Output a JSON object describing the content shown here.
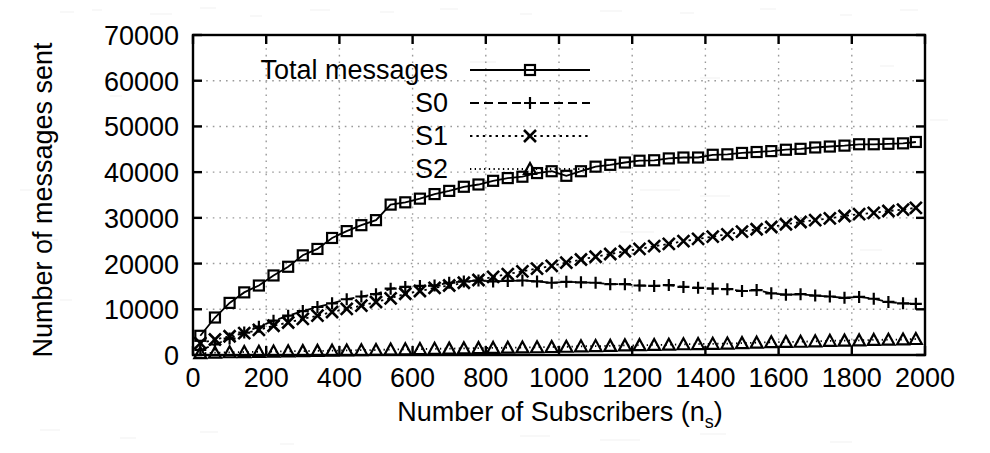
{
  "chart_data": {
    "type": "line",
    "title": "",
    "xlabel": "Number of Subscribers (n_s)",
    "xlabel_main": "Number of Subscribers (n",
    "xlabel_sub": "s",
    "xlabel_close": ")",
    "ylabel": "Number of messages sent",
    "xlim": [
      0,
      2000
    ],
    "ylim": [
      0,
      70000
    ],
    "xticks": [
      0,
      200,
      400,
      600,
      800,
      1000,
      1200,
      1400,
      1600,
      1800,
      2000
    ],
    "xtick_labels": [
      "0",
      "200",
      "400",
      "600",
      "800",
      "1000",
      "1200",
      "1400",
      "1600",
      "1800",
      "2000"
    ],
    "yticks": [
      0,
      10000,
      20000,
      30000,
      40000,
      50000,
      60000,
      70000
    ],
    "ytick_labels": [
      "0",
      "10000",
      "20000",
      "30000",
      "40000",
      "50000",
      "60000",
      "70000"
    ],
    "grid": true,
    "grid_style": "dotted",
    "legend_position": "top-left-inside",
    "x": [
      20,
      60,
      100,
      140,
      180,
      220,
      260,
      300,
      340,
      380,
      420,
      460,
      500,
      540,
      580,
      620,
      660,
      700,
      740,
      780,
      820,
      860,
      900,
      940,
      980,
      1020,
      1060,
      1100,
      1140,
      1180,
      1220,
      1260,
      1300,
      1340,
      1380,
      1420,
      1460,
      1500,
      1540,
      1580,
      1620,
      1660,
      1700,
      1740,
      1780,
      1820,
      1860,
      1900,
      1940,
      1975
    ],
    "series": [
      {
        "name": "Total messages",
        "marker": "square",
        "line_style": "solid",
        "values": [
          4200,
          8200,
          11400,
          13700,
          15200,
          17400,
          19300,
          21800,
          23200,
          25600,
          27100,
          28400,
          29500,
          32900,
          33400,
          34200,
          35200,
          35900,
          36800,
          37300,
          38100,
          38700,
          39000,
          39800,
          40200,
          39200,
          40200,
          41200,
          41600,
          42100,
          42500,
          42600,
          43000,
          43200,
          43200,
          43800,
          43900,
          44200,
          44400,
          44600,
          44900,
          45100,
          45400,
          45600,
          45800,
          46100,
          46100,
          46200,
          46300,
          46600
        ]
      },
      {
        "name": "S0",
        "marker": "plus",
        "line_style": "dashed",
        "values": [
          1100,
          2300,
          3600,
          4900,
          6200,
          7500,
          8600,
          9600,
          10500,
          11300,
          12200,
          12800,
          13300,
          14500,
          14900,
          15100,
          15200,
          15800,
          16100,
          16300,
          16100,
          16200,
          16300,
          16100,
          15800,
          16000,
          15900,
          15800,
          15500,
          15500,
          15200,
          15100,
          15300,
          14900,
          14700,
          14500,
          14400,
          14000,
          14200,
          13500,
          13200,
          13300,
          13000,
          12800,
          12500,
          12700,
          12300,
          11600,
          11300,
          11200
        ]
      },
      {
        "name": "S1",
        "marker": "cross",
        "line_style": "dotted",
        "values": [
          2600,
          3400,
          4100,
          4800,
          5500,
          6400,
          7100,
          7900,
          8600,
          9400,
          10100,
          10800,
          11600,
          12400,
          13400,
          14000,
          14700,
          15200,
          15800,
          16400,
          17100,
          17700,
          18300,
          18900,
          19500,
          20200,
          20900,
          21500,
          22100,
          22700,
          23200,
          23800,
          24300,
          24900,
          25400,
          25900,
          26400,
          27000,
          27500,
          28000,
          28600,
          29100,
          29500,
          29900,
          30400,
          30800,
          31100,
          31500,
          31800,
          32200
        ]
      },
      {
        "name": "S2",
        "marker": "triangle",
        "line_style": "fine-dotted",
        "values": [
          400,
          500,
          600,
          650,
          700,
          750,
          800,
          850,
          900,
          950,
          1000,
          1050,
          1100,
          1200,
          1250,
          1300,
          1350,
          1400,
          1450,
          1500,
          1550,
          1600,
          1650,
          1700,
          1750,
          1800,
          1900,
          1950,
          2000,
          2100,
          2150,
          2200,
          2250,
          2350,
          2400,
          2450,
          2500,
          2600,
          2700,
          2800,
          2850,
          2900,
          3000,
          3100,
          3150,
          3200,
          3300,
          3350,
          3400,
          3500
        ]
      }
    ]
  },
  "legend": {
    "items": [
      {
        "label": "Total messages",
        "marker": "square-marker",
        "style": "solid"
      },
      {
        "label": "S0",
        "marker": "plus-marker",
        "style": "dashed"
      },
      {
        "label": "S1",
        "marker": "cross-marker",
        "style": "dotted"
      },
      {
        "label": "S2",
        "marker": "triangle-marker",
        "style": "fine-dotted"
      }
    ]
  },
  "colors": {
    "ink": "#000000",
    "paper": "#ffffff",
    "grid": "#9a9a9a"
  }
}
